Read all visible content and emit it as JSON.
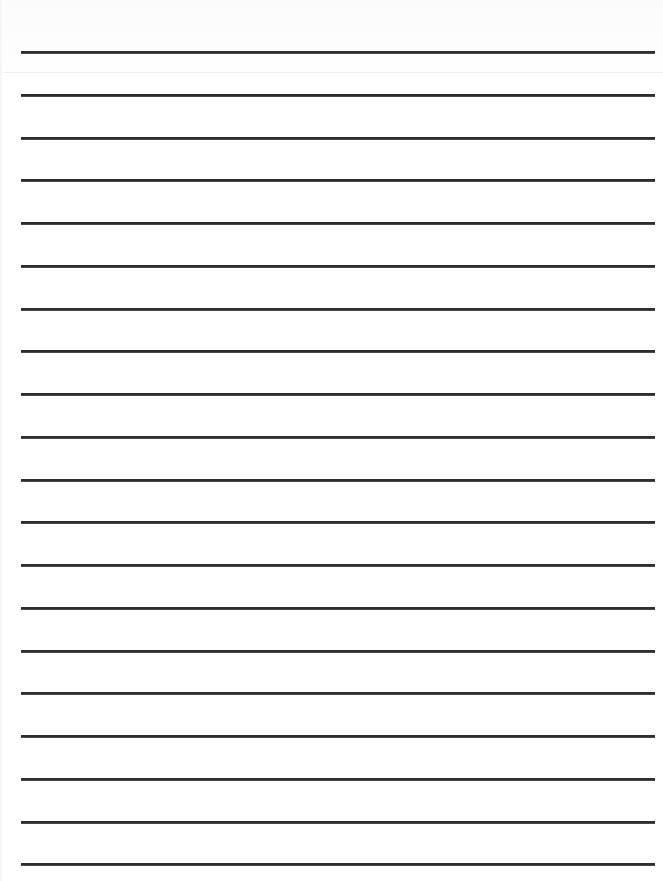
{
  "document": {
    "type": "ruled-lined-paper",
    "line_count": 20,
    "line_color": "#2e2e2e",
    "paper_color": "#ffffff",
    "text_content": ""
  }
}
